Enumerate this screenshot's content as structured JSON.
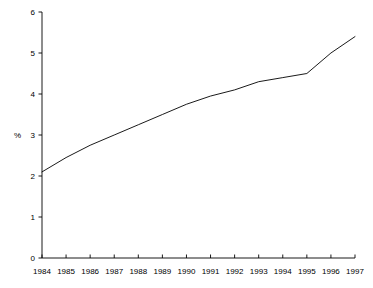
{
  "chart_data": {
    "type": "line",
    "title": "",
    "xlabel": "",
    "ylabel": "%",
    "x": [
      1984,
      1985,
      1986,
      1987,
      1988,
      1989,
      1990,
      1991,
      1992,
      1993,
      1994,
      1995,
      1996,
      1997
    ],
    "categories": [
      "1984",
      "1985",
      "1986",
      "1987",
      "1988",
      "1989",
      "1990",
      "1991",
      "1992",
      "1993",
      "1994",
      "1995",
      "1996",
      "1997"
    ],
    "values": [
      2.1,
      2.45,
      2.75,
      3.0,
      3.25,
      3.5,
      3.75,
      3.95,
      4.1,
      4.3,
      4.4,
      4.5,
      5.0,
      5.4
    ],
    "series": [
      {
        "name": "",
        "values": [
          2.1,
          2.45,
          2.75,
          3.0,
          3.25,
          3.5,
          3.75,
          3.95,
          4.1,
          4.3,
          4.4,
          4.5,
          5.0,
          5.4
        ]
      }
    ],
    "xlim": [
      1984,
      1997
    ],
    "ylim": [
      0,
      6
    ],
    "yticks": [
      0,
      1,
      2,
      3,
      4,
      5,
      6
    ],
    "ytick_labels": [
      "0",
      "1",
      "2",
      "3",
      "4",
      "5",
      "6"
    ],
    "xtick_labels": [
      "1984",
      "1985",
      "1986",
      "1987",
      "1988",
      "1989",
      "1990",
      "1991",
      "1992",
      "1993",
      "1994",
      "1995",
      "1996",
      "1997"
    ],
    "grid": false,
    "legend": false,
    "legend_position": "none",
    "line_color": "#000000",
    "axis_color": "#000000",
    "background_color": "#ffffff"
  }
}
